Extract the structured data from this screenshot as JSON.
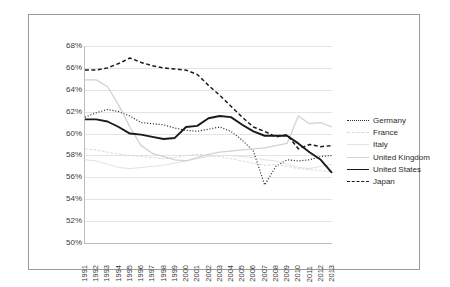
{
  "chart_data": {
    "type": "line",
    "title": "",
    "xlabel": "",
    "ylabel": "",
    "grid": "horizontal",
    "legend_position": "right",
    "ylim": [
      50,
      68
    ],
    "ytick_step": 2,
    "ytick_labels": [
      "68%",
      "66%",
      "64%",
      "62%",
      "60%",
      "58%",
      "56%",
      "54%",
      "52%",
      "50%"
    ],
    "ytick_values": [
      68,
      66,
      64,
      62,
      60,
      58,
      56,
      54,
      52,
      50
    ],
    "x": [
      1991,
      1992,
      1993,
      1994,
      1995,
      1996,
      1997,
      1998,
      1999,
      2000,
      2001,
      2002,
      2003,
      2004,
      2005,
      2006,
      2007,
      2008,
      2009,
      2010,
      2011,
      2012,
      2013
    ],
    "xtick_labels": [
      "1991",
      "1992",
      "1993",
      "1994",
      "1995",
      "1996",
      "1997",
      "1998",
      "1999",
      "2000",
      "2001",
      "2002",
      "2003",
      "2004",
      "2005",
      "2006",
      "2007",
      "2008",
      "2009",
      "2010",
      "2011",
      "2012",
      "2013"
    ],
    "series": [
      {
        "name": "Germany",
        "style": "dotted",
        "color": "#2b2b2b",
        "width": 1.2,
        "values": [
          61.5,
          61.9,
          62.2,
          62.0,
          61.6,
          61.0,
          60.9,
          60.8,
          60.5,
          60.3,
          60.2,
          60.4,
          60.6,
          60.2,
          59.4,
          58.4,
          55.3,
          57.0,
          57.6,
          57.5,
          57.6,
          57.9,
          58.0
        ]
      },
      {
        "name": "France",
        "style": "dashed",
        "color": "#d9d9d9",
        "width": 1.0,
        "values": [
          58.6,
          58.5,
          58.3,
          58.1,
          58.0,
          57.9,
          57.8,
          57.7,
          57.8,
          58.0,
          58.1,
          58.0,
          57.9,
          57.7,
          57.5,
          57.3,
          57.1,
          57.2,
          57.0,
          56.8,
          56.7,
          56.6,
          56.5
        ]
      },
      {
        "name": "Italy",
        "style": "solid",
        "color": "#e2e2e2",
        "width": 1.0,
        "values": [
          57.6,
          57.5,
          57.2,
          56.9,
          56.8,
          56.9,
          57.0,
          57.1,
          57.3,
          57.5,
          57.7,
          57.9,
          58.0,
          58.0,
          57.9,
          57.8,
          57.6,
          57.5,
          57.2,
          56.9,
          56.8,
          57.0,
          57.2
        ]
      },
      {
        "name": "United Kingdom",
        "style": "solid",
        "color": "#d2d2d2",
        "width": 1.3,
        "values": [
          64.9,
          64.9,
          64.3,
          62.6,
          60.6,
          58.9,
          58.2,
          57.9,
          57.6,
          57.5,
          57.8,
          58.1,
          58.3,
          58.4,
          58.5,
          58.6,
          58.7,
          58.9,
          59.1,
          61.6,
          60.9,
          61.0,
          60.6
        ]
      },
      {
        "name": "United States",
        "style": "solid",
        "color": "#1a1a1a",
        "width": 1.9,
        "values": [
          61.3,
          61.3,
          61.1,
          60.6,
          60.0,
          59.9,
          59.7,
          59.5,
          59.6,
          60.6,
          60.7,
          61.4,
          61.6,
          61.5,
          60.8,
          60.2,
          59.8,
          59.8,
          59.8,
          59.1,
          58.3,
          57.6,
          56.4
        ]
      },
      {
        "name": "Japan",
        "style": "dashed",
        "color": "#1a1a1a",
        "width": 1.5,
        "values": [
          65.8,
          65.8,
          66.0,
          66.4,
          66.9,
          66.5,
          66.2,
          66.0,
          65.9,
          65.8,
          65.4,
          64.4,
          63.5,
          62.5,
          61.5,
          60.6,
          60.2,
          59.7,
          59.9,
          58.6,
          59.0,
          58.8,
          58.9
        ]
      }
    ]
  },
  "legend": {
    "items": [
      {
        "label": "Germany"
      },
      {
        "label": "France"
      },
      {
        "label": "Italy"
      },
      {
        "label": "United Kingdom"
      },
      {
        "label": "United States"
      },
      {
        "label": "Japan"
      }
    ]
  }
}
